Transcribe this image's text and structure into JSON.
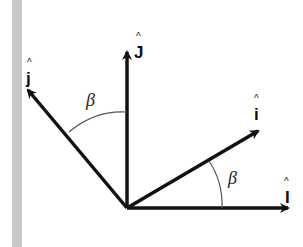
{
  "diagram": {
    "title": "",
    "vectors": [
      {
        "id": "J_fixed",
        "label": "J",
        "hat": "^",
        "direction": "vertical-up"
      },
      {
        "id": "j_rotated",
        "label": "j",
        "hat": "^",
        "direction": "up-left"
      },
      {
        "id": "i_rotated",
        "label": "i",
        "hat": "^",
        "direction": "up-right"
      },
      {
        "id": "I_fixed",
        "label": "I",
        "hat": "^",
        "direction": "horizontal-right"
      }
    ],
    "angles": [
      {
        "id": "beta_upper",
        "label": "β",
        "between": [
          "j_rotated",
          "J_fixed"
        ]
      },
      {
        "id": "beta_lower",
        "label": "β",
        "between": [
          "i_rotated",
          "I_fixed"
        ]
      }
    ],
    "colors": {
      "arrow": "#111111",
      "arc": "#555555",
      "strip": "#c9c9c9"
    }
  }
}
